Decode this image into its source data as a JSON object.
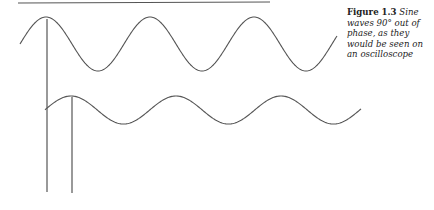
{
  "caption": {
    "label": "Figure 1.3",
    "text": "Sine waves 90° out of phase, as they would be seen on an oscilloscope"
  },
  "figure": {
    "line_color": "#555555",
    "top_rule": {
      "x1": 18,
      "y1": 3,
      "x2": 270,
      "y2": 2
    },
    "upper_wave": {
      "x_start": 20,
      "x_end": 337,
      "first_peak_x": 46,
      "center_y": 44,
      "amplitude": 27,
      "period": 104
    },
    "lower_wave": {
      "x_start": 45,
      "x_end": 361,
      "first_peak_x": 71,
      "center_y": 110,
      "amplitude": 14,
      "period": 105
    },
    "markers": [
      {
        "x": 47,
        "y_top": 19,
        "y_bottom": 192
      },
      {
        "x": 72,
        "y_top": 97,
        "y_bottom": 193
      }
    ]
  }
}
